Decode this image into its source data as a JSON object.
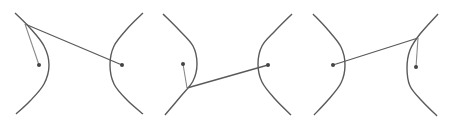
{
  "diagram": {
    "colors": {
      "curve": "#5a5a5a",
      "line": "#5a5a5a",
      "short_line": "#8a8a8a",
      "focus": "#444444",
      "background": "#ffffff"
    },
    "panels": [
      {
        "id": "panel-1",
        "left_branch": [
          [
            15,
            13
          ],
          [
            30,
            28
          ],
          [
            44,
            46
          ],
          [
            49,
            65
          ],
          [
            44,
            84
          ],
          [
            30,
            101
          ],
          [
            16,
            114
          ]
        ],
        "right_branch": [
          [
            143,
            13
          ],
          [
            127,
            29
          ],
          [
            114,
            46
          ],
          [
            110,
            65
          ],
          [
            114,
            84
          ],
          [
            127,
            100
          ],
          [
            143,
            114
          ]
        ],
        "focus_left": [
          39,
          65
        ],
        "focus_right": [
          122,
          65
        ],
        "point_p": [
          25,
          24
        ]
      },
      {
        "id": "panel-2",
        "left_branch": [
          [
            163,
            14
          ],
          [
            179,
            30
          ],
          [
            193,
            46
          ],
          [
            197,
            64
          ],
          [
            193,
            81
          ],
          [
            181,
            96
          ],
          [
            165,
            115
          ]
        ],
        "right_branch": [
          [
            292,
            14
          ],
          [
            275,
            31
          ],
          [
            262,
            46
          ],
          [
            258,
            64
          ],
          [
            262,
            82
          ],
          [
            275,
            99
          ],
          [
            291,
            115
          ]
        ],
        "focus_left": [
          183,
          64
        ],
        "focus_right": [
          268,
          65
        ],
        "point_p": [
          187,
          88
        ]
      },
      {
        "id": "panel-3",
        "left_branch": [
          [
            313,
            14
          ],
          [
            328,
            30
          ],
          [
            341,
            47
          ],
          [
            345,
            65
          ],
          [
            341,
            83
          ],
          [
            328,
            100
          ],
          [
            314,
            115
          ]
        ],
        "right_branch": [
          [
            438,
            14
          ],
          [
            420,
            34
          ],
          [
            410,
            50
          ],
          [
            407,
            68
          ],
          [
            410,
            86
          ],
          [
            422,
            101
          ],
          [
            437,
            116
          ]
        ],
        "focus_left": [
          333,
          65
        ],
        "focus_right": [
          416,
          67
        ],
        "point_p": [
          418,
          38
        ]
      }
    ]
  }
}
